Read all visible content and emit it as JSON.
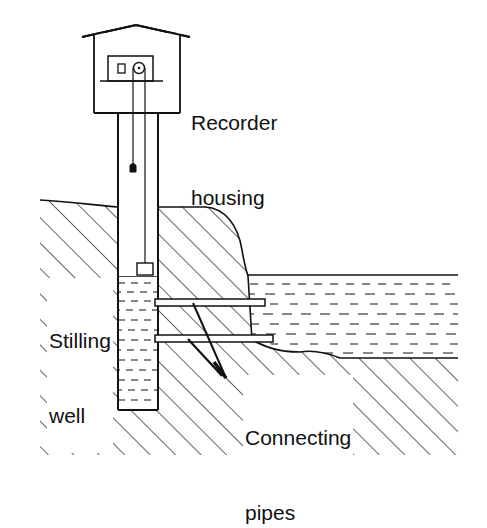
{
  "diagram": {
    "title": "",
    "type": "stilling well water-level gauge cross-section",
    "labels": {
      "recorder_housing": [
        "Recorder",
        "housing"
      ],
      "stilling_well": [
        "Stilling",
        "well"
      ],
      "connecting_pipes": [
        "Connecting",
        "pipes"
      ]
    },
    "components": [
      "recorder-housing",
      "recorder",
      "float-wire",
      "counterweight",
      "float",
      "stilling-well",
      "connecting-pipes",
      "river-bank",
      "stream-water"
    ],
    "colors": {
      "ink": "#111111",
      "background": "#ffffff"
    }
  }
}
